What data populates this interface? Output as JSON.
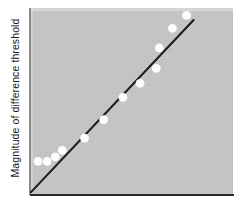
{
  "figure": {
    "name": "magnitude-of-difference-threshold-plot",
    "background_color": "#ffffff",
    "panel_color": "#c6c6c6",
    "axis_color": "#2b2b2b",
    "dot_color": "#fdfdfd",
    "line_color": "#1c1c1c"
  },
  "axes": {
    "ylabel": "Magnitude of difference threshold",
    "xlabel": "",
    "title": ""
  },
  "chart_data": {
    "type": "scatter",
    "title": "",
    "xlabel": "",
    "ylabel": "Magnitude of difference threshold",
    "xlim": [
      0,
      100
    ],
    "ylim": [
      0,
      100
    ],
    "grid": false,
    "legend": null,
    "axis_ticks": {
      "x": [],
      "y": []
    },
    "series": [
      {
        "name": "Observed difference thresholds",
        "marker": "filled-circle",
        "marker_color": "#fdfdfd",
        "points": [
          {
            "x": 3.5,
            "y": 17.5
          },
          {
            "x": 8.0,
            "y": 17.5
          },
          {
            "x": 12.0,
            "y": 20.0
          },
          {
            "x": 15.5,
            "y": 23.5
          },
          {
            "x": 26.5,
            "y": 30.0
          },
          {
            "x": 36.0,
            "y": 40.0
          },
          {
            "x": 45.5,
            "y": 52.0
          },
          {
            "x": 54.0,
            "y": 59.5
          },
          {
            "x": 62.0,
            "y": 67.5
          },
          {
            "x": 63.5,
            "y": 78.5
          },
          {
            "x": 70.0,
            "y": 89.0
          },
          {
            "x": 77.0,
            "y": 96.0
          }
        ]
      }
    ],
    "fit_line": {
      "name": "Weber's law best-fit line",
      "style": "solid",
      "color": "#1c1c1c",
      "start": {
        "x": 0.0,
        "y": 1.0
      },
      "end": {
        "x": 80.5,
        "y": 93.5
      }
    },
    "annotation": "Difference threshold increases in direct proportion to stimulus magnitude (Weber's law)."
  }
}
